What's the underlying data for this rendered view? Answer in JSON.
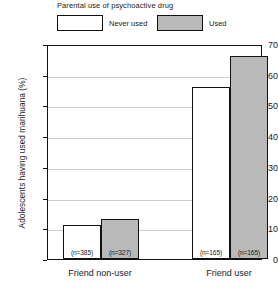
{
  "legend": {
    "title": "Parental use of psychoactive drug",
    "entries": [
      {
        "label": "Never used",
        "color": "#ffffff"
      },
      {
        "label": "Used",
        "color": "#b9b9b9"
      }
    ]
  },
  "chart_data": {
    "type": "bar",
    "title": "Parental use of psychoactive drug",
    "xlabel": "",
    "ylabel": "Adolescents having used marihuana (%)",
    "ylim": [
      0,
      70
    ],
    "yticks": [
      0,
      10,
      20,
      30,
      40,
      50,
      60,
      70
    ],
    "grid": true,
    "legend_position": "top",
    "categories": [
      "Friend non-user",
      "Friend user"
    ],
    "series": [
      {
        "name": "Never used",
        "color": "#ffffff",
        "values": [
          11,
          56
        ],
        "n_labels": [
          "(n=385)",
          "(n=165)"
        ]
      },
      {
        "name": "Used",
        "color": "#b9b9b9",
        "values": [
          13,
          66
        ],
        "n_labels": [
          "(n=327)",
          "(n=165)"
        ]
      }
    ]
  }
}
